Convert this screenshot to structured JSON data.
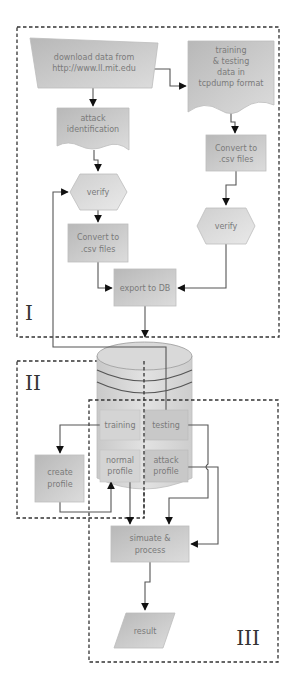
{
  "diagram": {
    "type": "flowchart",
    "regions": [
      {
        "id": "I",
        "label": "I"
      },
      {
        "id": "II",
        "label": "II"
      },
      {
        "id": "III",
        "label": "III"
      }
    ],
    "nodes": {
      "download": {
        "lines": [
          "download data from",
          "http://www.ll.mit.edu"
        ],
        "shape": "manual-input"
      },
      "tcpdump": {
        "lines": [
          "training",
          "& testing",
          "data in",
          "tcpdump format"
        ],
        "shape": "document"
      },
      "attack_id": {
        "lines": [
          "attack",
          "identification"
        ],
        "shape": "document"
      },
      "verify_left": {
        "lines": [
          "verify"
        ],
        "shape": "hexagon"
      },
      "convert_left": {
        "lines": [
          "Convert to",
          ".csv files"
        ],
        "shape": "process"
      },
      "convert_right": {
        "lines": [
          "Convert to",
          ".csv files"
        ],
        "shape": "process"
      },
      "verify_right": {
        "lines": [
          "verify"
        ],
        "shape": "hexagon"
      },
      "export_db": {
        "lines": [
          "export to DB"
        ],
        "shape": "process"
      },
      "database": {
        "lines": [],
        "shape": "database"
      },
      "training": {
        "lines": [
          "training"
        ],
        "shape": "db-section"
      },
      "testing": {
        "lines": [
          "testing"
        ],
        "shape": "db-section"
      },
      "normal_profile": {
        "lines": [
          "normal",
          "profile"
        ],
        "shape": "db-section"
      },
      "attack_profile": {
        "lines": [
          "attack",
          "profile"
        ],
        "shape": "db-section"
      },
      "create_profile": {
        "lines": [
          "create",
          "profile"
        ],
        "shape": "process"
      },
      "simulate": {
        "lines": [
          "simuate &",
          "process"
        ],
        "shape": "process"
      },
      "result": {
        "lines": [
          "result"
        ],
        "shape": "data"
      }
    },
    "edges": [
      {
        "from": "download",
        "to": "attack_id"
      },
      {
        "from": "download",
        "to": "tcpdump"
      },
      {
        "from": "attack_id",
        "to": "verify_left"
      },
      {
        "from": "verify_left",
        "to": "convert_left"
      },
      {
        "from": "tcpdump",
        "to": "convert_right"
      },
      {
        "from": "convert_right",
        "to": "verify_right"
      },
      {
        "from": "convert_left",
        "to": "export_db"
      },
      {
        "from": "verify_right",
        "to": "export_db"
      },
      {
        "from": "export_db",
        "to": "database"
      },
      {
        "from": "testing",
        "to": "verify_left"
      },
      {
        "from": "training",
        "to": "create_profile"
      },
      {
        "from": "create_profile",
        "to": "normal_profile"
      },
      {
        "from": "normal_profile",
        "to": "simulate"
      },
      {
        "from": "testing",
        "to": "simulate"
      },
      {
        "from": "attack_profile",
        "to": "simulate"
      },
      {
        "from": "simulate",
        "to": "result"
      }
    ]
  },
  "colors": {
    "shape_fill_light": "#e6e6e6",
    "shape_fill_dark": "#b5b5b5",
    "text": "#7a7a7a",
    "line": "#555555",
    "dash": "#333333"
  }
}
